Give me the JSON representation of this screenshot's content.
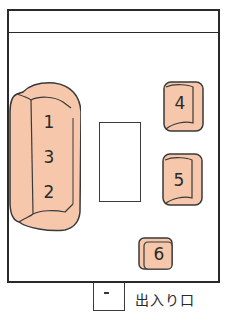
{
  "diagram": {
    "title": "",
    "sofa": {
      "labels": [
        "1",
        "3",
        "2"
      ]
    },
    "chairs": [
      {
        "label": "4"
      },
      {
        "label": "5"
      },
      {
        "label": "6"
      }
    ],
    "exit_label": "出入り口",
    "colors": {
      "seat_fill": "#f6c7ab",
      "line": "#2a2a2a"
    }
  }
}
